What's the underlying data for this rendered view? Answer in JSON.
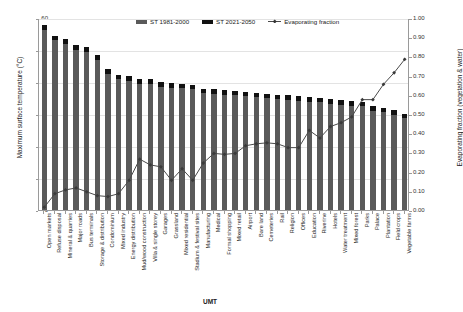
{
  "chart_data": {
    "type": "bar",
    "title": "",
    "xlabel": "UMT",
    "ylabel": "Maximum surface temperature (°C)",
    "ylabel_right": "Evaporating fraction (vegetation & water)",
    "ylim": [
      0,
      60
    ],
    "ylim_right": [
      0.0,
      1.0
    ],
    "yticks": [
      "0",
      "10",
      "20",
      "30",
      "40",
      "50",
      "60"
    ],
    "yticks_right": [
      "0.00",
      "0.10",
      "0.20",
      "0.30",
      "0.40",
      "0.50",
      "0.60",
      "0.70",
      "0.80",
      "0.90",
      "1.00"
    ],
    "grid": true,
    "legend_position": "top-center",
    "categories": [
      "Open markets",
      "Refuse disposal",
      "Mineral & quarries",
      "Major roads",
      "Bus terminals",
      "Storage & distribution",
      "Condominium",
      "Mixed industry",
      "Energy distribution",
      "Mud/wood construction",
      "Villa & single storey",
      "Garages",
      "Grassland",
      "Mixed residential",
      "Stadium & festival sites",
      "Manufacturing",
      "Medical",
      "Formal shopping",
      "Mixed retail",
      "Airport",
      "Bare land",
      "Cemeteries",
      "Rail",
      "Religion",
      "Offices",
      "Education",
      "Riverine",
      "Hotels",
      "Water treatment",
      "Mixed forest",
      "Parks",
      "Palace",
      "Plantation",
      "Field crops",
      "Vegetable farms"
    ],
    "series": [
      {
        "name": "ST 1981-2000",
        "color": "#5a5a5a",
        "axis": "left",
        "values": [
          56.3,
          53.1,
          52.0,
          50.1,
          49.4,
          47.0,
          42.6,
          40.8,
          40.4,
          39.5,
          39.4,
          38.5,
          38.2,
          38.1,
          37.8,
          36.5,
          36.4,
          36.0,
          35.8,
          35.6,
          35.3,
          35.0,
          34.6,
          34.4,
          34.2,
          33.9,
          33.6,
          33.2,
          32.9,
          32.6,
          32.4,
          31.0,
          30.6,
          29.8,
          28.6
        ]
      },
      {
        "name": "ST 2021-2050",
        "color": "#111111",
        "axis": "left",
        "values": [
          57.8,
          54.5,
          53.4,
          51.5,
          50.8,
          48.4,
          44.0,
          42.2,
          41.8,
          40.9,
          40.8,
          39.9,
          39.6,
          39.5,
          39.2,
          37.9,
          37.8,
          37.4,
          37.2,
          37.0,
          36.7,
          36.4,
          36.0,
          35.8,
          35.6,
          35.3,
          35.0,
          34.6,
          34.3,
          34.0,
          33.8,
          32.4,
          32.0,
          31.2,
          30.0
        ]
      },
      {
        "name": "Evaporating fraction",
        "color": "#4a4a4a",
        "axis": "right",
        "marker": "diamond",
        "values": [
          0.02,
          0.09,
          0.11,
          0.12,
          0.1,
          0.08,
          0.075,
          0.09,
          0.16,
          0.27,
          0.24,
          0.23,
          0.16,
          0.22,
          0.16,
          0.25,
          0.3,
          0.295,
          0.3,
          0.34,
          0.35,
          0.355,
          0.35,
          0.33,
          0.33,
          0.42,
          0.38,
          0.44,
          0.46,
          0.49,
          0.58,
          0.58,
          0.66,
          0.72,
          0.79
        ]
      }
    ]
  },
  "legend": {
    "items": [
      {
        "label": "ST 1981-2000"
      },
      {
        "label": "ST 2021-2050"
      },
      {
        "label": "Evaporating fraction"
      }
    ]
  }
}
